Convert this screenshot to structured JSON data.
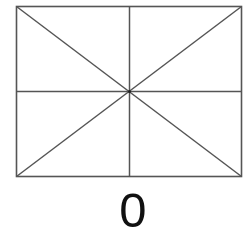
{
  "diagram": {
    "shape": "rectangle-with-diagonals-and-midlines",
    "rect": {
      "x": 16,
      "y": 6,
      "width": 225,
      "height": 170
    },
    "center": {
      "x": 129,
      "y": 91
    },
    "stroke_color": "#555555",
    "lines": [
      {
        "name": "diagonal-tl-br",
        "x1": 16,
        "y1": 6,
        "x2": 241,
        "y2": 176
      },
      {
        "name": "diagonal-tr-bl",
        "x1": 241,
        "y1": 6,
        "x2": 16,
        "y2": 176
      },
      {
        "name": "vertical-midline",
        "x1": 129,
        "y1": 6,
        "x2": 129,
        "y2": 176
      },
      {
        "name": "horizontal-midline",
        "x1": 16,
        "y1": 91,
        "x2": 241,
        "y2": 91
      }
    ],
    "label": "0"
  }
}
